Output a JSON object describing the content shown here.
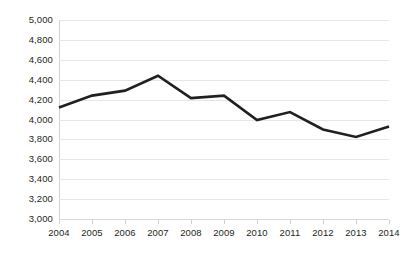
{
  "chart_data": {
    "type": "line",
    "title": "",
    "subtitle": "",
    "xlabel": "",
    "ylabel": "",
    "categories": [
      "2004",
      "2005",
      "2006",
      "2007",
      "2008",
      "2009",
      "2010",
      "2011",
      "2012",
      "2013",
      "2014"
    ],
    "x": [
      2004,
      2005,
      2006,
      2007,
      2008,
      2009,
      2010,
      2011,
      2012,
      2013,
      2014
    ],
    "values": [
      4120,
      4240,
      4290,
      4440,
      4215,
      4240,
      3995,
      4075,
      3900,
      3825,
      3930
    ],
    "series": [
      {
        "name": "",
        "values": [
          4120,
          4240,
          4290,
          4440,
          4215,
          4240,
          3995,
          4075,
          3900,
          3825,
          3930
        ]
      }
    ],
    "ylim": [
      3000,
      5000
    ],
    "ytick_step": 200,
    "ytick_labels": [
      "5,000",
      "4,800",
      "4,600",
      "4,400",
      "4,200",
      "4,000",
      "3,800",
      "3,600",
      "3,400",
      "3,200",
      "3,000"
    ],
    "ytick_values": [
      5000,
      4800,
      4600,
      4400,
      4200,
      4000,
      3800,
      3600,
      3400,
      3200,
      3000
    ],
    "xtick_labels": [
      "2004",
      "2005",
      "2006",
      "2007",
      "2008",
      "2009",
      "2010",
      "2011",
      "2012",
      "2013",
      "2014"
    ],
    "grid": "horizontal",
    "legend": "none",
    "line_color": "#231f20",
    "grid_color": "#e6e6e6",
    "background_color": "#ffffff",
    "text_color": "#231f20",
    "annotations": []
  }
}
